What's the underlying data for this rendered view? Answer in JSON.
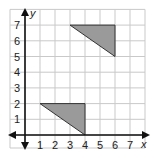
{
  "chart_data": {
    "type": "coordinate-grid",
    "xlabel": "x",
    "ylabel": "y",
    "xlim": [
      -1,
      8
    ],
    "ylim": [
      -1,
      8
    ],
    "x_ticks": [
      "1",
      "2",
      "3",
      "4",
      "5",
      "6",
      "7"
    ],
    "y_ticks": [
      "1",
      "2",
      "3",
      "4",
      "5",
      "6",
      "7"
    ],
    "grid": true,
    "shapes": [
      {
        "name": "triangle-A",
        "vertices": [
          [
            1,
            2
          ],
          [
            4,
            2
          ],
          [
            4,
            0
          ]
        ],
        "fill": "#9a9a9a"
      },
      {
        "name": "triangle-B",
        "vertices": [
          [
            3,
            7
          ],
          [
            6,
            7
          ],
          [
            6,
            5
          ]
        ],
        "fill": "#9a9a9a"
      }
    ]
  },
  "colors": {
    "grid": "#c9c9c9",
    "axis": "#111111",
    "shape_fill": "#9a9a9a",
    "shape_stroke": "#333333"
  }
}
